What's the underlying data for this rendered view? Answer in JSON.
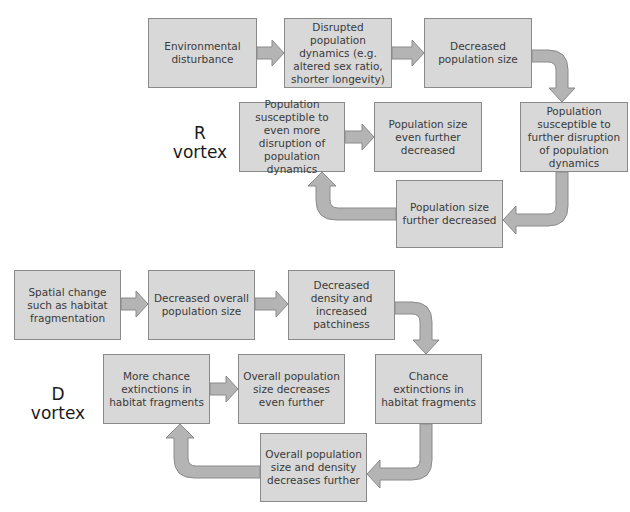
{
  "colors": {
    "box_fill": "#d8d8d8",
    "box_border": "#8a8a8a",
    "arrow_fill": "#b4b4b4",
    "arrow_stroke": "#8a8a8a",
    "text": "#3a3a3a"
  },
  "r_vortex": {
    "label_line1": "R",
    "label_line2": "vortex",
    "boxes": [
      {
        "id": "environmental-disturbance",
        "text": "Environmental disturbance"
      },
      {
        "id": "disrupted-population-dynamics",
        "text": "Disrupted population dynamics (e.g. altered sex ratio, shorter longevity)"
      },
      {
        "id": "decreased-population-size",
        "text": "Decreased population size"
      },
      {
        "id": "susceptible-further-disruption",
        "text": "Population susceptible to further disruption of population dynamics"
      },
      {
        "id": "population-size-further-decreased",
        "text": "Population size further decreased"
      },
      {
        "id": "susceptible-even-more-disruption",
        "text": "Population susceptible to even more disruption of population dynamics"
      },
      {
        "id": "population-size-even-further-decreased",
        "text": "Population size even  further decreased"
      }
    ]
  },
  "d_vortex": {
    "label_line1": "D",
    "label_line2": "vortex",
    "boxes": [
      {
        "id": "spatial-change",
        "text": "Spatial change such as habitat fragmentation"
      },
      {
        "id": "decreased-overall-population-size",
        "text": "Decreased overall population size"
      },
      {
        "id": "decreased-density-increased-patchiness",
        "text": "Decreased density and increased patchiness"
      },
      {
        "id": "chance-extinctions",
        "text": "Chance extinctions in habitat fragments"
      },
      {
        "id": "overall-size-density-decreases-further",
        "text": "Overall population size and density decreases further"
      },
      {
        "id": "more-chance-extinctions",
        "text": "More chance extinctions in habitat fragments"
      },
      {
        "id": "overall-size-decreases-even-further",
        "text": "Overall population size decreases even further"
      }
    ]
  }
}
